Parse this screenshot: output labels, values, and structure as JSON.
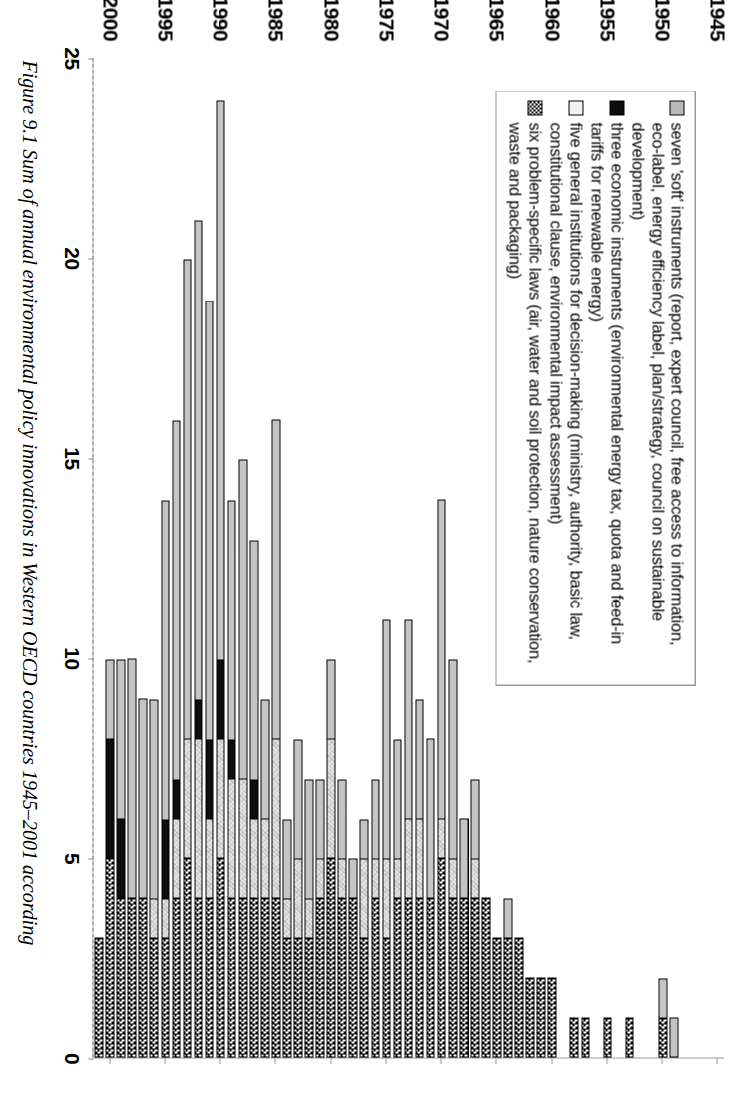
{
  "figure": {
    "caption_number": "Figure 9.1",
    "caption_text": "Sum of annual environmental policy innovations in Western OECD countries 1945–2001 according"
  },
  "legend": {
    "items": [
      {
        "key": "soft",
        "swatch": "grey-square-swatch",
        "label": "seven 'soft' instruments (report, expert council, free access to information, eco-label, energy efficiency label, plan/strategy, council on sustainable development)"
      },
      {
        "key": "econ",
        "swatch": "black-square-swatch",
        "label": "three economic instruments (environmental energy tax, quota and feed-in tariffs for renewable energy)"
      },
      {
        "key": "inst",
        "swatch": "white-square-swatch",
        "label": "five general institutions for decision-making (ministry, authority, basic law, constitutional clause, environmental impact assessment)"
      },
      {
        "key": "laws",
        "swatch": "checkered-square-swatch",
        "label": "six problem-specific laws (air, water and soil protection, nature conservation, waste and packaging)"
      }
    ]
  },
  "axes": {
    "value_axis": {
      "ticks": [
        "0",
        "5",
        "10",
        "15",
        "20",
        "25"
      ],
      "min": 0,
      "max": 25
    },
    "category_axis": {
      "ticks": [
        "1945",
        "1950",
        "1955",
        "1960",
        "1965",
        "1970",
        "1975",
        "1980",
        "1985",
        "1990",
        "1995",
        "2000"
      ]
    }
  },
  "chart_data": {
    "type": "bar",
    "orientation": "horizontal",
    "stacked": true,
    "title": "Sum of annual environmental policy innovations in Western OECD countries 1945–2001",
    "xlabel": "",
    "ylabel": "",
    "xlim": [
      0,
      25
    ],
    "grid": false,
    "legend_position": "top-left",
    "categories": [
      1945,
      1946,
      1947,
      1948,
      1949,
      1950,
      1951,
      1952,
      1953,
      1954,
      1955,
      1956,
      1957,
      1958,
      1959,
      1960,
      1961,
      1962,
      1963,
      1964,
      1965,
      1966,
      1967,
      1968,
      1969,
      1970,
      1971,
      1972,
      1973,
      1974,
      1975,
      1976,
      1977,
      1978,
      1979,
      1980,
      1981,
      1982,
      1983,
      1984,
      1985,
      1986,
      1987,
      1988,
      1989,
      1990,
      1991,
      1992,
      1993,
      1994,
      1995,
      1996,
      1997,
      1998,
      1999,
      2000,
      2001
    ],
    "series": [
      {
        "name": "six problem-specific laws (air, water and soil protection, nature conservation, waste and packaging)",
        "key": "laws",
        "fill": "checkered",
        "values": [
          0,
          0,
          0,
          0,
          0,
          1,
          0,
          0,
          1,
          0,
          1,
          0,
          1,
          1,
          0,
          2,
          2,
          2,
          3,
          3,
          3,
          4,
          4,
          4,
          4,
          5,
          4,
          4,
          4,
          4,
          3,
          4,
          3,
          4,
          4,
          5,
          4,
          3,
          3,
          3,
          4,
          4,
          4,
          4,
          4,
          5,
          4,
          4,
          5,
          4,
          3,
          3,
          4,
          4,
          4,
          5,
          3
        ]
      },
      {
        "name": "five general institutions for decision-making (ministry, authority, basic law, constitutional clause, environmental impact assessment)",
        "key": "inst",
        "fill": "light",
        "values": [
          0,
          0,
          0,
          0,
          0,
          0,
          0,
          0,
          0,
          0,
          0,
          0,
          0,
          0,
          0,
          0,
          0,
          0,
          0,
          0,
          0,
          0,
          1,
          0,
          1,
          1,
          0,
          2,
          2,
          1,
          2,
          1,
          2,
          0,
          1,
          3,
          1,
          1,
          2,
          1,
          4,
          2,
          2,
          3,
          3,
          3,
          2,
          4,
          3,
          2,
          1,
          1,
          0,
          0,
          0,
          0,
          0
        ]
      },
      {
        "name": "three economic instruments (environmental energy tax, quota and feed-in tariffs for renewable energy)",
        "key": "econ",
        "fill": "black",
        "values": [
          0,
          0,
          0,
          0,
          0,
          0,
          0,
          0,
          0,
          0,
          0,
          0,
          0,
          0,
          0,
          0,
          0,
          0,
          0,
          0,
          0,
          0,
          0,
          0,
          0,
          0,
          0,
          0,
          0,
          0,
          0,
          0,
          0,
          0,
          0,
          0,
          0,
          0,
          0,
          0,
          0,
          0,
          1,
          0,
          1,
          2,
          2,
          1,
          0,
          1,
          2,
          0,
          0,
          0,
          2,
          3,
          0
        ]
      },
      {
        "name": "seven 'soft' instruments (report, expert council, free access to information, eco-label, energy efficiency label, plan/strategy, council on sustainable development)",
        "key": "soft",
        "fill": "grey",
        "values": [
          0,
          0,
          0,
          0,
          1,
          1,
          0,
          0,
          0,
          0,
          0,
          0,
          0,
          0,
          0,
          0,
          0,
          0,
          0,
          1,
          0,
          0,
          2,
          2,
          5,
          8,
          4,
          3,
          5,
          3,
          6,
          2,
          1,
          1,
          2,
          2,
          2,
          3,
          3,
          2,
          8,
          3,
          6,
          8,
          6,
          14,
          11,
          12,
          12,
          9,
          8,
          5,
          5,
          6,
          4,
          2,
          0
        ]
      }
    ]
  }
}
